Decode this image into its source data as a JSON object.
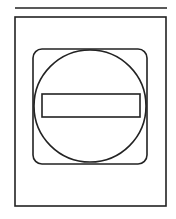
{
  "figure": {
    "stroke_color": "#222222",
    "background": "#ffffff",
    "elements": {
      "top_line": {
        "x1": 15,
        "y1": 8,
        "x2": 167,
        "y2": 8
      },
      "outer_frame": {
        "x": 15,
        "y": 17,
        "w": 151,
        "h": 189
      },
      "inner_rounded_square": {
        "x": 33,
        "y": 49,
        "w": 114,
        "h": 115,
        "r": 9
      },
      "circle": {
        "cx": 90,
        "cy": 106,
        "r": 56
      },
      "bar": {
        "x": 42,
        "y": 94,
        "w": 98,
        "h": 23
      }
    }
  }
}
